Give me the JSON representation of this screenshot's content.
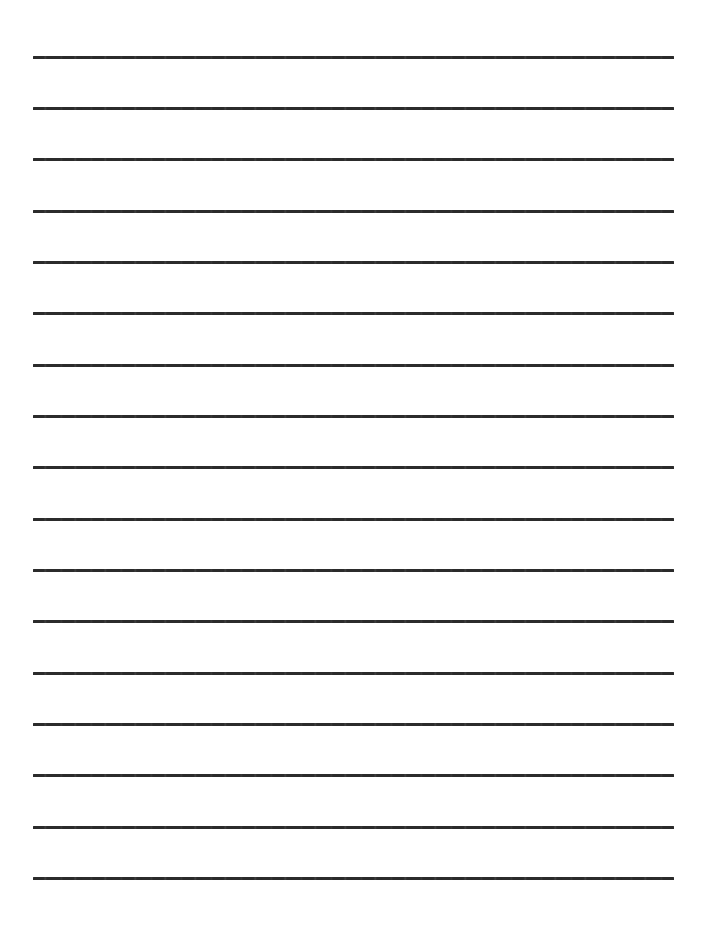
{
  "document": {
    "type": "lined-writing-paper",
    "title": "Blank Lined Paper",
    "background_color": "#ffffff",
    "page_width": 710,
    "page_height": 929,
    "orientation": "portrait",
    "content_text": ""
  },
  "ruling": {
    "line_color": "#2b2b2b",
    "line_count": 17,
    "line_thickness_px": 3,
    "line_left_px": 33,
    "line_right_px": 674,
    "line_length_px": 641,
    "line_spacing_px": 51.3,
    "first_line_y_px": 56,
    "last_line_y_px": 877,
    "top_margin_px": 56,
    "bottom_margin_px": 52,
    "left_margin_px": 33,
    "right_margin_px": 36,
    "style": "single-rule",
    "has_vertical_margin_rule": false,
    "has_page_border": false,
    "has_header": false,
    "has_footer": false,
    "has_holes": false,
    "lines": [
      {
        "index": 1,
        "y": 56,
        "x1": 33,
        "x2": 674
      },
      {
        "index": 2,
        "y": 107,
        "x1": 33,
        "x2": 674
      },
      {
        "index": 3,
        "y": 158,
        "x1": 33,
        "x2": 674
      },
      {
        "index": 4,
        "y": 210,
        "x1": 33,
        "x2": 674
      },
      {
        "index": 5,
        "y": 261,
        "x1": 33,
        "x2": 674
      },
      {
        "index": 6,
        "y": 312,
        "x1": 33,
        "x2": 674
      },
      {
        "index": 7,
        "y": 364,
        "x1": 33,
        "x2": 674
      },
      {
        "index": 8,
        "y": 415,
        "x1": 33,
        "x2": 674
      },
      {
        "index": 9,
        "y": 466,
        "x1": 33,
        "x2": 674
      },
      {
        "index": 10,
        "y": 518,
        "x1": 33,
        "x2": 674
      },
      {
        "index": 11,
        "y": 569,
        "x1": 33,
        "x2": 674
      },
      {
        "index": 12,
        "y": 620,
        "x1": 33,
        "x2": 674
      },
      {
        "index": 13,
        "y": 672,
        "x1": 33,
        "x2": 674
      },
      {
        "index": 14,
        "y": 723,
        "x1": 33,
        "x2": 674
      },
      {
        "index": 15,
        "y": 774,
        "x1": 33,
        "x2": 674
      },
      {
        "index": 16,
        "y": 826,
        "x1": 33,
        "x2": 674
      },
      {
        "index": 17,
        "y": 877,
        "x1": 33,
        "x2": 674
      }
    ]
  }
}
